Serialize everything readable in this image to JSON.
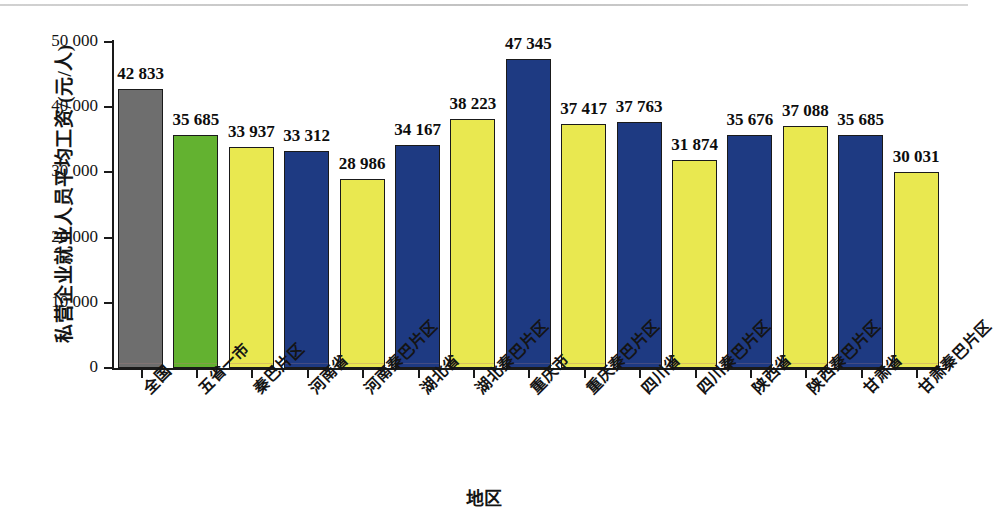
{
  "chart_data": {
    "type": "bar",
    "title": "",
    "xlabel": "地区",
    "ylabel": "私营企业就业人员平均工资/(元/人)",
    "ylim": [
      0,
      50000
    ],
    "grid": false,
    "legend": "none",
    "ytick_labels": [
      "0",
      "10 000",
      "20 000",
      "30 000",
      "40 000",
      "50 000"
    ],
    "ytick_values": [
      0,
      10000,
      20000,
      30000,
      40000,
      50000
    ],
    "categories": [
      "全国",
      "五省一市",
      "秦巴片区",
      "河南省",
      "河南秦巴片区",
      "湖北省",
      "湖北秦巴片区",
      "重庆市",
      "重庆秦巴片区",
      "四川省",
      "四川秦巴片区",
      "陕西省",
      "陕西秦巴片区",
      "甘肃省",
      "甘肃秦巴片区"
    ],
    "values": [
      42833,
      35685,
      33937,
      33312,
      28986,
      34167,
      38223,
      47345,
      37417,
      37763,
      31874,
      35676,
      37088,
      35685,
      30031
    ],
    "value_labels": [
      "42 833",
      "35 685",
      "33 937",
      "33 312",
      "28 986",
      "34 167",
      "38 223",
      "47 345",
      "37 417",
      "37 763",
      "31 874",
      "35 676",
      "37 088",
      "35 685",
      "30 031"
    ],
    "bar_colors": [
      "#6e6e6e",
      "#63b230",
      "#e9e850",
      "#1e3a82",
      "#e9e850",
      "#1e3a82",
      "#e9e850",
      "#1e3a82",
      "#e9e850",
      "#1e3a82",
      "#e9e850",
      "#1e3a82",
      "#e9e850",
      "#1e3a82",
      "#e9e850"
    ],
    "bar_color_classes": [
      "gray",
      "green",
      "yellow",
      "navy",
      "yellow",
      "navy",
      "yellow",
      "navy",
      "yellow",
      "navy",
      "yellow",
      "navy",
      "yellow",
      "navy",
      "yellow"
    ],
    "palette": {
      "gray": "#6e6e6e",
      "green": "#63b230",
      "yellow": "#e9e850",
      "navy": "#1e3a82",
      "axis": "#1a1a1a",
      "text": "#141414",
      "background": "#ffffff"
    }
  }
}
